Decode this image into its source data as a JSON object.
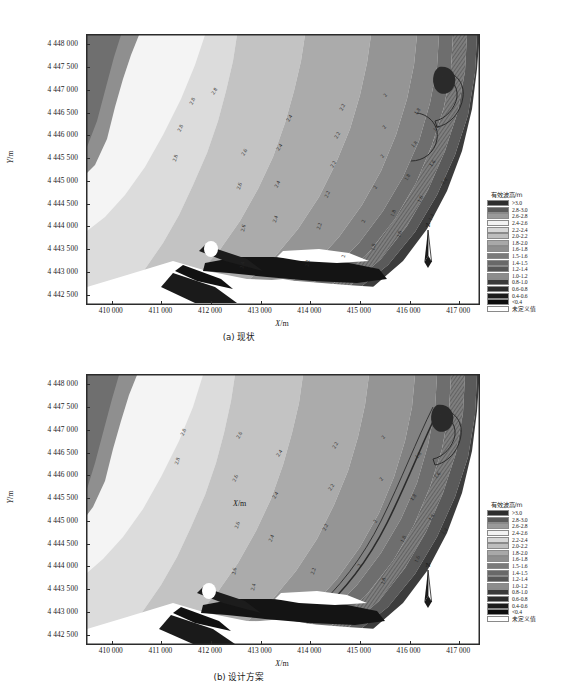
{
  "figure": {
    "axis": {
      "x_title": "X",
      "x_unit": "/m",
      "y_title": "Y",
      "y_unit": "/m",
      "x_ticks": [
        "410 000",
        "411 000",
        "412 000",
        "413 000",
        "414 000",
        "415 000",
        "416 000",
        "417 000"
      ],
      "y_ticks": [
        "4 448 000",
        "4 447 500",
        "4 447 000",
        "4 446 500",
        "4 446 000",
        "4 445 500",
        "4 445 000",
        "4 444 500",
        "4 444 000",
        "4 443 500",
        "4 443 000",
        "4 442 500"
      ],
      "x_min": 409500,
      "x_max": 417400,
      "y_min": 4442300,
      "y_max": 4448200
    },
    "north_arrow_label": "N",
    "stray_label": {
      "title": "X",
      "unit": "/m"
    },
    "legend": {
      "title": "有效波高/m",
      "entries": [
        {
          "label": ">3.0",
          "color": "#2e2e2e"
        },
        {
          "label": "2.8-3.0",
          "color": "#5b5b5b"
        },
        {
          "label": "2.6-2.8",
          "color": "#9a9a9a"
        },
        {
          "label": "2.4-2.6",
          "color": "#f2f2f2"
        },
        {
          "label": "2.2-2.4",
          "color": "#d6d6d6"
        },
        {
          "label": "2.0-2.2",
          "color": "#bdbdbd"
        },
        {
          "label": "1.8-2.0",
          "color": "#a8a8a8"
        },
        {
          "label": "1.6-1.8",
          "color": "#8e8e8e"
        },
        {
          "label": "1.5-1.6",
          "color": "#7a7a7a"
        },
        {
          "label": "1.4-1.5",
          "color": "#686868"
        },
        {
          "label": "1.2-1.4",
          "color": "#575757"
        },
        {
          "label": "1.0-1.2",
          "color": "#8c8c8c"
        },
        {
          "label": "0.8-1.0",
          "color": "#3a3a3a"
        },
        {
          "label": "0.6-0.8",
          "color": "#2a2a2a"
        },
        {
          "label": "0.4-0.6",
          "color": "#1c1c1c"
        },
        {
          "label": "<0.4",
          "color": "#0d0d0d"
        },
        {
          "label": "未定义值",
          "color": "#ffffff"
        }
      ]
    },
    "panels": [
      {
        "id": "a",
        "caption": "(a) 现状",
        "contour_labels": [
          {
            "text": "2.8",
            "x": 105,
            "y": 66,
            "rot": -62
          },
          {
            "text": "2.8",
            "x": 93,
            "y": 93,
            "rot": -62
          },
          {
            "text": "2.8",
            "x": 88,
            "y": 123,
            "rot": -72
          },
          {
            "text": "2.8",
            "x": 127,
            "y": 56,
            "rot": -55
          },
          {
            "text": "2.6",
            "x": 157,
            "y": 117,
            "rot": -60
          },
          {
            "text": "2.6",
            "x": 152,
            "y": 151,
            "rot": -70
          },
          {
            "text": "2.6",
            "x": 156,
            "y": 193,
            "rot": -75
          },
          {
            "text": "2.4",
            "x": 202,
            "y": 83,
            "rot": -58
          },
          {
            "text": "2.4",
            "x": 192,
            "y": 112,
            "rot": -55
          },
          {
            "text": "2.4",
            "x": 190,
            "y": 149,
            "rot": -62
          },
          {
            "text": "2.4",
            "x": 188,
            "y": 184,
            "rot": -70
          },
          {
            "text": "2.4",
            "x": 155,
            "y": 230,
            "rot": -78
          },
          {
            "text": "2.2",
            "x": 255,
            "y": 72,
            "rot": -62
          },
          {
            "text": "2.2",
            "x": 250,
            "y": 100,
            "rot": -58
          },
          {
            "text": "2.2",
            "x": 246,
            "y": 129,
            "rot": -58
          },
          {
            "text": "2.2",
            "x": 240,
            "y": 159,
            "rot": -66
          },
          {
            "text": "2.2",
            "x": 232,
            "y": 191,
            "rot": -72
          },
          {
            "text": "2.2",
            "x": 220,
            "y": 228,
            "rot": -80
          },
          {
            "text": "2",
            "x": 298,
            "y": 60,
            "rot": -55
          },
          {
            "text": "2",
            "x": 297,
            "y": 92,
            "rot": -52
          },
          {
            "text": "2",
            "x": 295,
            "y": 121,
            "rot": -54
          },
          {
            "text": "2",
            "x": 288,
            "y": 152,
            "rot": -60
          },
          {
            "text": "2",
            "x": 276,
            "y": 186,
            "rot": -70
          },
          {
            "text": "2",
            "x": 256,
            "y": 221,
            "rot": -80
          },
          {
            "text": "1.8",
            "x": 330,
            "y": 76,
            "rot": -52
          },
          {
            "text": "1.8",
            "x": 327,
            "y": 109,
            "rot": -50
          },
          {
            "text": "1.8",
            "x": 320,
            "y": 142,
            "rot": -58
          },
          {
            "text": "1.8",
            "x": 306,
            "y": 178,
            "rot": -68
          },
          {
            "text": "1.8",
            "x": 286,
            "y": 212,
            "rot": -78
          },
          {
            "text": "1.6",
            "x": 349,
            "y": 93,
            "rot": -48
          },
          {
            "text": "1.6",
            "x": 345,
            "y": 128,
            "rot": -52
          },
          {
            "text": "1.6",
            "x": 333,
            "y": 164,
            "rot": -62
          },
          {
            "text": "1.6",
            "x": 312,
            "y": 199,
            "rot": -74
          },
          {
            "text": "1.4",
            "x": 357,
            "y": 146,
            "rot": -50
          },
          {
            "text": "1.4",
            "x": 344,
            "y": 182,
            "rot": -66
          }
        ]
      },
      {
        "id": "b",
        "caption": "(b) 设计方案",
        "contour_labels": [
          {
            "text": "2.8",
            "x": 96,
            "y": 57,
            "rot": -62
          },
          {
            "text": "2.8",
            "x": 90,
            "y": 86,
            "rot": -70
          },
          {
            "text": "2.6",
            "x": 152,
            "y": 60,
            "rot": -58
          },
          {
            "text": "2.6",
            "x": 148,
            "y": 103,
            "rot": -64
          },
          {
            "text": "2.6",
            "x": 150,
            "y": 150,
            "rot": -72
          },
          {
            "text": "2.6",
            "x": 147,
            "y": 196,
            "rot": -78
          },
          {
            "text": "2.4",
            "x": 192,
            "y": 78,
            "rot": -56
          },
          {
            "text": "2.4",
            "x": 188,
            "y": 120,
            "rot": -58
          },
          {
            "text": "2.4",
            "x": 184,
            "y": 163,
            "rot": -66
          },
          {
            "text": "2.4",
            "x": 166,
            "y": 212,
            "rot": -76
          },
          {
            "text": "2.2",
            "x": 248,
            "y": 70,
            "rot": -60
          },
          {
            "text": "2.2",
            "x": 244,
            "y": 112,
            "rot": -56
          },
          {
            "text": "2.2",
            "x": 238,
            "y": 152,
            "rot": -62
          },
          {
            "text": "2.2",
            "x": 226,
            "y": 196,
            "rot": -72
          },
          {
            "text": "2",
            "x": 296,
            "y": 62,
            "rot": -54
          },
          {
            "text": "2",
            "x": 294,
            "y": 104,
            "rot": -52
          },
          {
            "text": "2",
            "x": 288,
            "y": 146,
            "rot": -58
          },
          {
            "text": "2",
            "x": 272,
            "y": 190,
            "rot": -70
          },
          {
            "text": "1.8",
            "x": 331,
            "y": 80,
            "rot": -50
          },
          {
            "text": "1.8",
            "x": 326,
            "y": 122,
            "rot": -52
          },
          {
            "text": "1.8",
            "x": 316,
            "y": 164,
            "rot": -62
          },
          {
            "text": "1.8",
            "x": 296,
            "y": 206,
            "rot": -74
          },
          {
            "text": "1.6",
            "x": 350,
            "y": 100,
            "rot": -48
          },
          {
            "text": "1.6",
            "x": 344,
            "y": 142,
            "rot": -54
          },
          {
            "text": "1.6",
            "x": 330,
            "y": 184,
            "rot": -66
          },
          {
            "text": "1.4",
            "x": 357,
            "y": 156,
            "rot": -50
          }
        ]
      }
    ]
  },
  "chart_data": {
    "type": "heatmap",
    "title": "有效波高/m",
    "xlabel": "X/m",
    "ylabel": "Y/m",
    "xlim": [
      409500,
      417400
    ],
    "ylim": [
      4442300,
      4448200
    ],
    "grid": false,
    "legend_position": "right",
    "panels": [
      {
        "label": "(a) 现状",
        "contour_levels": [
          2.8,
          2.6,
          2.4,
          2.2,
          2.0,
          1.8,
          1.6,
          1.4,
          1.2,
          1.0,
          0.8,
          0.6,
          0.4
        ]
      },
      {
        "label": "(b) 设计方案",
        "contour_levels": [
          2.8,
          2.6,
          2.4,
          2.2,
          2.0,
          1.8,
          1.6,
          1.4,
          1.2,
          1.0,
          0.8,
          0.6,
          0.4
        ]
      }
    ],
    "bands": [
      {
        "range": ">3.0",
        "min": 3.0,
        "max": null
      },
      {
        "range": "2.8-3.0",
        "min": 2.8,
        "max": 3.0
      },
      {
        "range": "2.6-2.8",
        "min": 2.6,
        "max": 2.8
      },
      {
        "range": "2.4-2.6",
        "min": 2.4,
        "max": 2.6
      },
      {
        "range": "2.2-2.4",
        "min": 2.2,
        "max": 2.4
      },
      {
        "range": "2.0-2.2",
        "min": 2.0,
        "max": 2.2
      },
      {
        "range": "1.8-2.0",
        "min": 1.8,
        "max": 2.0
      },
      {
        "range": "1.6-1.8",
        "min": 1.6,
        "max": 1.8
      },
      {
        "range": "1.5-1.6",
        "min": 1.5,
        "max": 1.6
      },
      {
        "range": "1.4-1.5",
        "min": 1.4,
        "max": 1.5
      },
      {
        "range": "1.2-1.4",
        "min": 1.2,
        "max": 1.4
      },
      {
        "range": "1.0-1.2",
        "min": 1.0,
        "max": 1.2
      },
      {
        "range": "0.8-1.0",
        "min": 0.8,
        "max": 1.0
      },
      {
        "range": "0.6-0.8",
        "min": 0.6,
        "max": 0.8
      },
      {
        "range": "0.4-0.6",
        "min": 0.4,
        "max": 0.6
      },
      {
        "range": "<0.4",
        "min": null,
        "max": 0.4
      },
      {
        "range": "未定义值",
        "min": null,
        "max": null
      }
    ]
  }
}
